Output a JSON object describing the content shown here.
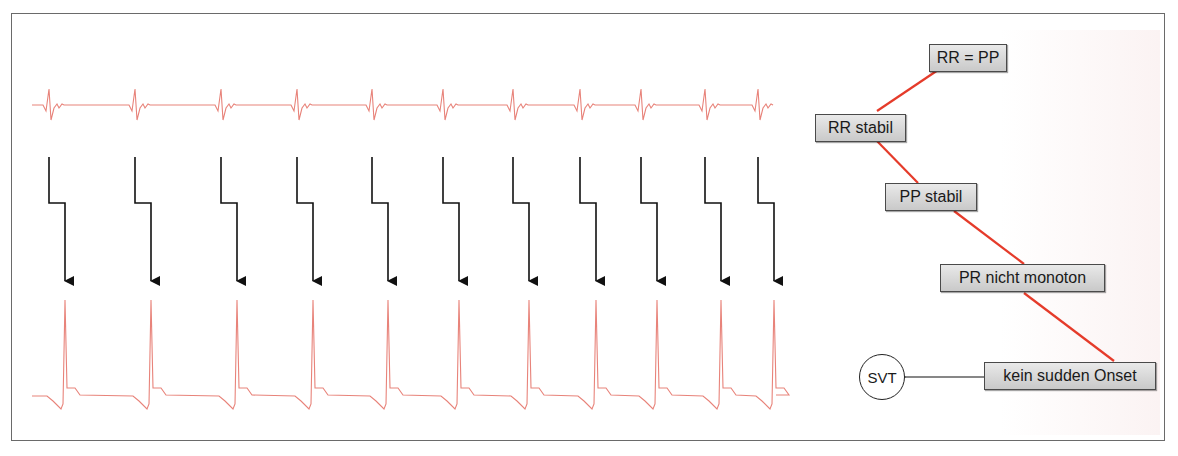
{
  "figure": {
    "type": "ecg-algorithm-diagram",
    "colors": {
      "ecg_trace": "#e8837a",
      "decision_path": "#e53b2a",
      "arrows": "#111111",
      "node_fill_top": "#e9e9e9",
      "node_fill_bottom": "#c9c9c9",
      "frame_border": "#6a6a6a"
    }
  },
  "left_panel": {
    "top_trace": {
      "label": "atrial electrogram",
      "beats": 11
    },
    "bottom_trace": {
      "label": "ventricular electrogram",
      "beats": 11
    },
    "conduction_arrows": [
      {
        "x_start": 49,
        "x_end": 65
      },
      {
        "x_start": 135,
        "x_end": 151
      },
      {
        "x_start": 221,
        "x_end": 237
      },
      {
        "x_start": 297,
        "x_end": 313
      },
      {
        "x_start": 372,
        "x_end": 388
      },
      {
        "x_start": 443,
        "x_end": 459
      },
      {
        "x_start": 513,
        "x_end": 529
      },
      {
        "x_start": 580,
        "x_end": 596
      },
      {
        "x_start": 641,
        "x_end": 657
      },
      {
        "x_start": 705,
        "x_end": 721
      },
      {
        "x_start": 758,
        "x_end": 774
      }
    ]
  },
  "decision_tree": {
    "nodes": [
      {
        "id": "rr_pp",
        "label": "RR = PP"
      },
      {
        "id": "rr_stabil",
        "label": "RR stabil"
      },
      {
        "id": "pp_stabil",
        "label": "PP stabil"
      },
      {
        "id": "pr_nicht_monoton",
        "label": "PR nicht monoton"
      },
      {
        "id": "kein_sudden_onset",
        "label": "kein sudden Onset"
      }
    ],
    "result": {
      "label": "SVT"
    }
  }
}
